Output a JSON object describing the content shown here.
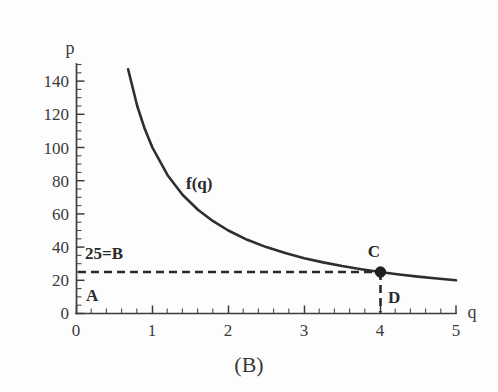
{
  "figure": {
    "caption": "(B)",
    "curve_label": "f(q)",
    "x_axis_name": "q",
    "y_axis_name": "p",
    "ink_color": "#2e2e2e",
    "background_color": "#fdfdfd"
  },
  "annotations": {
    "origin_label": "A",
    "price_label": "25=B",
    "curve_point_label": "C",
    "quantity_label": "D"
  },
  "chart_data": {
    "type": "line",
    "title": "(B)",
    "subtitle": "",
    "xlabel": "q",
    "ylabel": "p",
    "xlim": [
      0,
      5
    ],
    "ylim": [
      0,
      150
    ],
    "grid": false,
    "legend": false,
    "x_ticks": [
      0,
      1,
      2,
      3,
      4,
      5
    ],
    "x_tick_labels": [
      "0",
      "1",
      "2",
      "3",
      "4",
      "5"
    ],
    "x_minor_tick_step": 0.2,
    "y_ticks": [
      0,
      20,
      40,
      60,
      80,
      100,
      120,
      140
    ],
    "y_tick_labels": [
      "0",
      "20",
      "40",
      "60",
      "80",
      "100",
      "120",
      "140"
    ],
    "y_minor_tick_step": 5,
    "series": [
      {
        "name": "f(q)",
        "equation": "f(q) = 100/q",
        "style": "solid",
        "x": [
          0.68,
          0.8,
          0.9,
          1.0,
          1.2,
          1.4,
          1.6,
          1.8,
          2.0,
          2.25,
          2.5,
          2.75,
          3.0,
          3.25,
          3.5,
          3.75,
          4.0,
          4.25,
          4.5,
          4.75,
          5.0
        ],
        "y": [
          147.1,
          125.0,
          111.1,
          100.0,
          83.3,
          71.4,
          62.5,
          55.6,
          50.0,
          44.4,
          40.0,
          36.4,
          33.3,
          30.8,
          28.6,
          26.7,
          25.0,
          23.5,
          22.2,
          21.1,
          20.0
        ]
      }
    ],
    "reference_lines": [
      {
        "name": "price-line",
        "orientation": "horizontal",
        "value": 25,
        "from": 0,
        "to": 4,
        "style": "dashed",
        "label": "25=B"
      },
      {
        "name": "quantity-line",
        "orientation": "vertical",
        "value": 4,
        "from": 0,
        "to": 25,
        "style": "dashed",
        "label": "D"
      }
    ],
    "points": [
      {
        "name": "C",
        "x": 4,
        "y": 25,
        "marker": "filled-circle",
        "label": "C"
      }
    ],
    "annotations": [
      {
        "text": "A",
        "x": 0.18,
        "y": 10
      },
      {
        "text": "25=B",
        "x": 0.12,
        "y": 34
      },
      {
        "text": "C",
        "x": 3.92,
        "y": 37
      },
      {
        "text": "D",
        "x": 4.18,
        "y": 9
      },
      {
        "text": "f(q)",
        "x": 1.65,
        "y": 79
      }
    ]
  }
}
